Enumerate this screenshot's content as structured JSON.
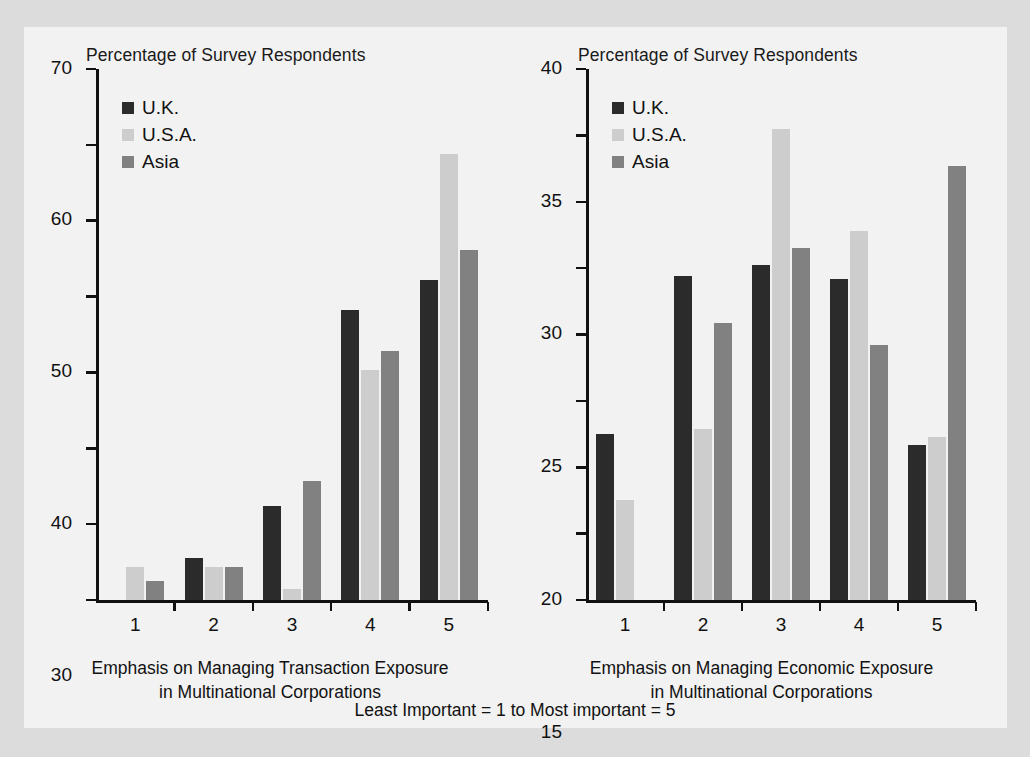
{
  "figure": {
    "background_color": "#dcdcdc",
    "panel_color": "#f2f2f2",
    "footer_note": "Least Important = 1 to Most important = 5"
  },
  "series_colors": {
    "uk": "#2b2b2b",
    "usa": "#cdcdcd",
    "asia": "#818181"
  },
  "legend": {
    "uk_label": "U.K.",
    "usa_label": "U.S.A.",
    "asia_label": "Asia"
  },
  "chart_data": [
    {
      "id": "transaction-exposure",
      "type": "bar",
      "title": "Percentage of Survey Respondents",
      "ylabel": "Percentage of Survey Respondents",
      "xlabel": "Emphasis on Managing Transaction Exposure in Multinational Corporations",
      "xlabel_line1": "Emphasis on Managing Transaction Exposure",
      "xlabel_line2": "in Multinational Corporations",
      "categories": [
        "1",
        "2",
        "3",
        "4",
        "5"
      ],
      "ylim": [
        0,
        70
      ],
      "yticks": [
        0,
        10,
        20,
        30,
        40,
        50,
        60,
        70
      ],
      "ytick_labels": [
        "0",
        "10",
        "20",
        "30",
        "40",
        "50",
        "60",
        "70"
      ],
      "grid": false,
      "legend_position": "top-left",
      "series": [
        {
          "name": "U.K.",
          "key": "uk",
          "values": [
            0,
            5.6,
            12.4,
            38.2,
            42.2
          ]
        },
        {
          "name": "U.S.A.",
          "key": "usa",
          "values": [
            4.3,
            4.3,
            1.5,
            30.3,
            58.8
          ]
        },
        {
          "name": "Asia",
          "key": "asia",
          "values": [
            2.5,
            4.3,
            15.7,
            32.8,
            46.1
          ]
        }
      ]
    },
    {
      "id": "economic-exposure",
      "type": "bar",
      "title": "Percentage of Survey Respondents",
      "ylabel": "Percentage of Survey Respondents",
      "xlabel": "Emphasis on Managing Economic Exposure in Multinational Corporations",
      "xlabel_line1": "Emphasis on Managing Economic Exposure",
      "xlabel_line2": "in Multinational Corporations",
      "categories": [
        "1",
        "2",
        "3",
        "4",
        "5"
      ],
      "ylim": [
        0,
        40
      ],
      "yticks": [
        0,
        5,
        10,
        15,
        20,
        25,
        30,
        35,
        40
      ],
      "ytick_labels": [
        "0",
        "5",
        "10",
        "15",
        "20",
        "25",
        "30",
        "35",
        "40"
      ],
      "grid": false,
      "legend_position": "top-left",
      "series": [
        {
          "name": "U.K.",
          "key": "uk",
          "values": [
            12.5,
            24.4,
            25.2,
            24.2,
            11.7
          ]
        },
        {
          "name": "U.S.A.",
          "key": "usa",
          "values": [
            7.5,
            12.9,
            35.5,
            27.8,
            12.3
          ]
        },
        {
          "name": "Asia",
          "key": "asia",
          "values": [
            0,
            20.9,
            26.5,
            19.2,
            32.7
          ]
        }
      ]
    }
  ]
}
